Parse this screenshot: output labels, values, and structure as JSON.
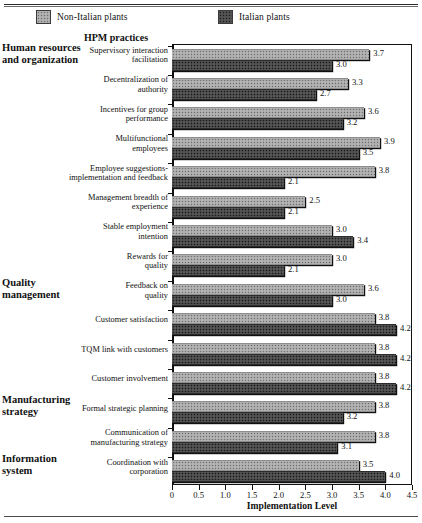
{
  "legend": {
    "series": [
      {
        "key": "non_italian",
        "label": "Non-Italian plants",
        "swatch": "light-gray-dotted"
      },
      {
        "key": "italian",
        "label": "Italian plants",
        "swatch": "dark-gray-dotted"
      }
    ]
  },
  "headers": {
    "practices_column": "HPM practices"
  },
  "sections": [
    {
      "label": "Human resources\nand organization",
      "line1": "Human resources",
      "line2": "and organization"
    },
    {
      "label": "Quality\nmanagement",
      "line1": "Quality",
      "line2": "management"
    },
    {
      "label": "Manufacturing\nstrategy",
      "line1": "Manufacturing",
      "line2": "strategy"
    },
    {
      "label": "Information\nsystem",
      "line1": "Information",
      "line2": "system"
    }
  ],
  "axis": {
    "x_title": "Implementation Level",
    "x_ticks": [
      "0",
      "0.5",
      "1.0",
      "1.5",
      "2.0",
      "2.5",
      "3.0",
      "3.5",
      "4.0",
      "4.5"
    ],
    "x_min": 0,
    "x_max": 4.5
  },
  "chart_data": {
    "type": "bar",
    "orientation": "horizontal",
    "title": "",
    "xlabel": "Implementation Level",
    "ylabel": "HPM practices",
    "xlim": [
      0,
      4.5
    ],
    "grid": false,
    "legend_position": "top",
    "categories": [
      "Supervisory interaction facilitation",
      "Decentralization of authority",
      "Incentives for group performance",
      "Multifunctional employees",
      "Employee suggestions-implementation and feedback",
      "Management breadth of experience",
      "Stable employment intention",
      "Rewards for quality",
      "Feedback on quality",
      "Customer satisfaction",
      "TQM link with customers",
      "Customer involvement",
      "Formal strategic planning",
      "Communication of manufacturing strategy",
      "Coordination with corporation"
    ],
    "category_lines": [
      [
        "Supervisory interaction",
        "facilitation"
      ],
      [
        "Decentralization of",
        "authority"
      ],
      [
        "Incentives for group",
        "performance"
      ],
      [
        "Multifunctional",
        "employees"
      ],
      [
        "Employee suggestions-",
        "implementation and feedback"
      ],
      [
        "Management breadth of",
        "experience"
      ],
      [
        "Stable employment",
        "intention"
      ],
      [
        "Rewards for",
        "quality"
      ],
      [
        "Feedback on",
        "quality"
      ],
      [
        "Customer satisfaction"
      ],
      [
        "TQM link with customers"
      ],
      [
        "Customer involvement"
      ],
      [
        "Formal strategic planning"
      ],
      [
        "Communication of",
        "manufacturing strategy"
      ],
      [
        "Coordination with",
        "corporation"
      ]
    ],
    "section_of_category": [
      0,
      0,
      0,
      0,
      0,
      0,
      0,
      0,
      1,
      1,
      1,
      1,
      2,
      2,
      3
    ],
    "series": [
      {
        "name": "Non-Italian plants",
        "values": [
          3.7,
          3.3,
          3.6,
          3.9,
          3.8,
          2.5,
          3.0,
          3.0,
          3.6,
          3.8,
          3.8,
          3.8,
          3.8,
          3.8,
          3.5
        ],
        "labels": [
          "3.7",
          "3.3",
          "3.6",
          "3.9",
          "3.8",
          "2.5",
          "3.0",
          "3.0",
          "3.6",
          "3.8",
          "3.8",
          "3.8",
          "3.8",
          "3.8",
          "3.5"
        ]
      },
      {
        "name": "Italian plants",
        "values": [
          3.0,
          2.7,
          3.2,
          3.5,
          2.1,
          2.1,
          3.4,
          2.1,
          3.0,
          4.2,
          4.2,
          4.2,
          3.2,
          3.1,
          4.0
        ],
        "labels": [
          "3.0",
          "2.7",
          "3.2",
          "3.5",
          "2.1",
          "2.1",
          "3.4",
          "2.1",
          "3.0",
          "4.2",
          "4.2",
          "4.2",
          "3.2",
          "3.1",
          "4.0"
        ]
      }
    ]
  }
}
